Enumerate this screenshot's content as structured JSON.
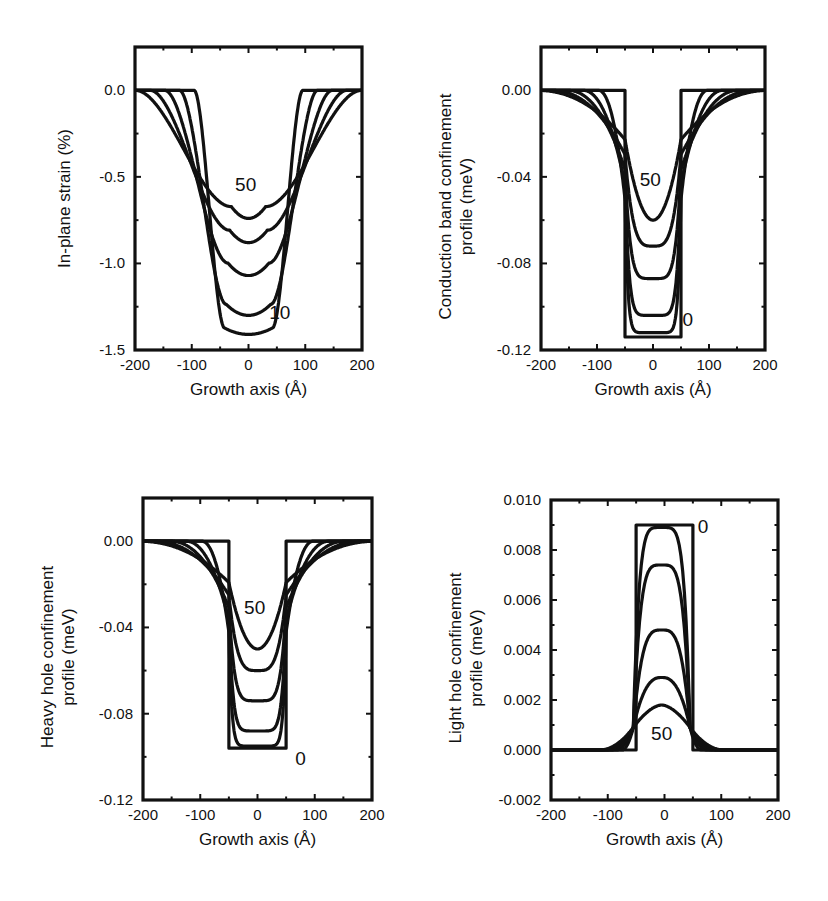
{
  "chart_data": [
    {
      "id": "strain",
      "type": "line",
      "title": "",
      "xlabel": "Growth axis  (Å)",
      "ylabel": "In-plane strain (%)",
      "xlim": [
        -200,
        200
      ],
      "ylim": [
        -1.5,
        0.25
      ],
      "xticks": [
        -200,
        -100,
        0,
        100,
        200
      ],
      "yticks": [
        0.0,
        -0.5,
        -1.0,
        -1.5
      ],
      "ytick_labels": [
        "0.0",
        "-0.5",
        "-1.0",
        "-1.5"
      ],
      "grid": false,
      "legend": "none",
      "annotations": [
        {
          "text": "50",
          "x": -5,
          "y": -0.58
        },
        {
          "text": "10",
          "x": 55,
          "y": -1.32
        }
      ],
      "series_note": "Family of well profiles; labels mark extreme curves (50 shallowest, 10 deepest)",
      "series": [
        {
          "name": "10",
          "min": -1.41,
          "halfwidth": 55,
          "edge": 10
        },
        {
          "name": "20",
          "min": -1.3,
          "halfwidth": 58,
          "edge": 20
        },
        {
          "name": "30",
          "min": -1.07,
          "halfwidth": 62,
          "edge": 30
        },
        {
          "name": "40",
          "min": -0.88,
          "halfwidth": 66,
          "edge": 40
        },
        {
          "name": "50",
          "min": -0.74,
          "halfwidth": 70,
          "edge": 50
        }
      ],
      "frame": {
        "left": 135,
        "right": 362,
        "top": 47,
        "bottom": 350
      }
    },
    {
      "id": "conduction",
      "type": "line",
      "title": "",
      "xlabel": "Growth axis  (Å)",
      "ylabel": [
        "Conduction band confinement",
        "profile (meV)"
      ],
      "xlim": [
        -200,
        200
      ],
      "ylim": [
        -0.12,
        0.02
      ],
      "xticks": [
        -200,
        -100,
        0,
        100,
        200
      ],
      "yticks": [
        0.0,
        -0.04,
        -0.08,
        -0.12
      ],
      "ytick_labels": [
        "0.00",
        "-0.04",
        "-0.08",
        "-0.12"
      ],
      "grid": false,
      "legend": "none",
      "annotations": [
        {
          "text": "50",
          "x": -5,
          "y": -0.044
        },
        {
          "text": "0",
          "x": 62,
          "y": -0.109
        }
      ],
      "well": {
        "halfwidth": 50,
        "depth": -0.114
      },
      "series": [
        {
          "name": "0",
          "min": -0.114,
          "edge": 0
        },
        {
          "name": "10",
          "min": -0.112,
          "edge": 10
        },
        {
          "name": "20",
          "min": -0.104,
          "edge": 20
        },
        {
          "name": "30",
          "min": -0.087,
          "edge": 30
        },
        {
          "name": "40",
          "min": -0.072,
          "edge": 40
        },
        {
          "name": "50",
          "min": -0.06,
          "edge": 50
        }
      ],
      "frame": {
        "left": 541,
        "right": 765,
        "top": 47,
        "bottom": 350
      }
    },
    {
      "id": "heavy-hole",
      "type": "line",
      "title": "",
      "xlabel": "Growth axis  (Å)",
      "ylabel": [
        "Heavy hole confinement",
        "profile (meV)"
      ],
      "xlim": [
        -200,
        200
      ],
      "ylim": [
        -0.12,
        0.02
      ],
      "xticks": [
        -200,
        -100,
        0,
        100,
        200
      ],
      "yticks": [
        0.0,
        -0.04,
        -0.08,
        -0.12
      ],
      "ytick_labels": [
        "0.00",
        "-0.04",
        "-0.08",
        "-0.12"
      ],
      "grid": false,
      "legend": "none",
      "annotations": [
        {
          "text": "50",
          "x": -5,
          "y": -0.034
        },
        {
          "text": "0",
          "x": 75,
          "y": -0.104
        }
      ],
      "well": {
        "halfwidth": 50,
        "depth": -0.096
      },
      "series": [
        {
          "name": "0",
          "min": -0.096,
          "edge": 0
        },
        {
          "name": "10",
          "min": -0.095,
          "edge": 10
        },
        {
          "name": "20",
          "min": -0.088,
          "edge": 20
        },
        {
          "name": "30",
          "min": -0.074,
          "edge": 30
        },
        {
          "name": "40",
          "min": -0.06,
          "edge": 40
        },
        {
          "name": "50",
          "min": -0.05,
          "edge": 50
        }
      ],
      "frame": {
        "left": 143,
        "right": 372,
        "top": 498,
        "bottom": 800
      }
    },
    {
      "id": "light-hole",
      "type": "line",
      "title": "",
      "xlabel": "Growth axis  (Å)",
      "ylabel": [
        "Light hole confinement",
        "profile (meV)"
      ],
      "xlim": [
        -200,
        200
      ],
      "ylim": [
        -0.002,
        0.01
      ],
      "xticks": [
        -200,
        -100,
        0,
        100,
        200
      ],
      "yticks": [
        0.01,
        0.008,
        0.006,
        0.004,
        0.002,
        0.0,
        -0.002
      ],
      "ytick_labels": [
        "0.010",
        "0.008",
        "0.006",
        "0.004",
        "0.002",
        "0.000",
        "-0.002"
      ],
      "grid": false,
      "legend": "none",
      "annotations": [
        {
          "text": "0",
          "x": 68,
          "y": 0.0087
        },
        {
          "text": "50",
          "x": -5,
          "y": 0.0004
        }
      ],
      "well": {
        "halfwidth": 50,
        "height": 0.009
      },
      "series": [
        {
          "name": "0",
          "max": 0.009,
          "edge": 0
        },
        {
          "name": "10",
          "max": 0.0089,
          "edge": 10
        },
        {
          "name": "20",
          "max": 0.0074,
          "edge": 20
        },
        {
          "name": "30",
          "max": 0.0048,
          "edge": 30
        },
        {
          "name": "40",
          "max": 0.0029,
          "edge": 40
        },
        {
          "name": "50",
          "max": 0.0018,
          "edge": 50
        }
      ],
      "frame": {
        "left": 551,
        "right": 778,
        "top": 500,
        "bottom": 800
      }
    }
  ]
}
